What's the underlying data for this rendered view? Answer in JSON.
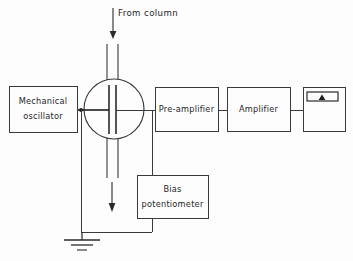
{
  "diagram": {
    "background_color": "#fdfdfd",
    "line_color": "#3a3a3a",
    "text_color": "#262626"
  },
  "blocks": {
    "mechanical_oscillator": {
      "label_line1": "Mechanical",
      "label_line2": "oscillator",
      "x": 9,
      "y": 86,
      "w": 68,
      "h": 46
    },
    "pre_amplifier": {
      "label": "Pre-amplifier",
      "x": 155,
      "y": 87,
      "w": 63,
      "h": 44
    },
    "amplifier": {
      "label": "Amplifier",
      "x": 227,
      "y": 87,
      "w": 63,
      "h": 44
    },
    "recorder": {
      "label": "",
      "x": 303,
      "y": 87,
      "w": 42,
      "h": 44,
      "strip": {
        "x": 307,
        "y": 92,
        "w": 31,
        "h": 9
      },
      "pointer_x": 322
    },
    "bias_potentiometer": {
      "label_line1": "Bias",
      "label_line2": "potentiometer",
      "x": 137,
      "y": 175,
      "w": 71,
      "h": 43
    }
  },
  "detector_cell": {
    "name": "detector-cell",
    "center_x": 114,
    "center_y": 109,
    "radius": 30,
    "plate_left_x": 109,
    "plate_right_x": 116,
    "plate_top_y": 85,
    "plate_bottom_y": 134
  },
  "annotations": {
    "inlet_label": "From  column",
    "inlet_label_x": 118,
    "inlet_label_y": 15,
    "inlet_arrow": {
      "x": 113,
      "y_start": 8,
      "y_end": 38
    },
    "outlet_arrow": {
      "x": 112,
      "y_start": 182,
      "y_end": 211
    }
  },
  "wiring": {
    "signal_line_y": 110,
    "ground_bus_y": 232,
    "oscillator_drop_x": 81,
    "bias_tap_x": 152,
    "ground_symbol_x": 82,
    "ground_bars": [
      {
        "y": 240,
        "half_width": 18
      },
      {
        "y": 245,
        "half_width": 11
      },
      {
        "y": 250,
        "half_width": 5
      }
    ]
  }
}
